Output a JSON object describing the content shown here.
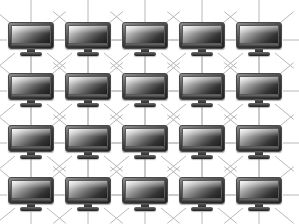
{
  "diagram": {
    "type": "network-mesh-grid",
    "background_color": "#ffffff",
    "link_color": "#b8b8b8",
    "link_width": 1,
    "canvas": {
      "width": 299,
      "height": 224
    },
    "grid": {
      "columns": 5,
      "rows": 4,
      "column_x": [
        31,
        88,
        145,
        202,
        259
      ],
      "row_y": [
        40,
        91,
        143,
        195
      ],
      "column_spacing": 57,
      "row_spacing": 51
    },
    "node": {
      "icon": "computer-monitor-icon",
      "label": "",
      "width": 46,
      "height": 36,
      "bezel_color": "#2b2b2b",
      "screen_gradient_from": "#f2f2f2",
      "screen_gradient_to": "#1d1d1d",
      "stand_color": "#3a3a3a"
    },
    "links": {
      "directions": [
        "horizontal",
        "vertical",
        "diagonal-down-right",
        "diagonal-down-left"
      ],
      "ray_length": 26,
      "description": "Each monitor node emits eight connector rays; rays meet midway to form horizontal bars, vertical bars and X crossings between neighbouring nodes."
    },
    "node_count": 20,
    "nodes": [
      {
        "id": "node-r1-c1",
        "row": 1,
        "col": 1,
        "x": 31,
        "y": 40
      },
      {
        "id": "node-r1-c2",
        "row": 1,
        "col": 2,
        "x": 88,
        "y": 40
      },
      {
        "id": "node-r1-c3",
        "row": 1,
        "col": 3,
        "x": 145,
        "y": 40
      },
      {
        "id": "node-r1-c4",
        "row": 1,
        "col": 4,
        "x": 202,
        "y": 40
      },
      {
        "id": "node-r1-c5",
        "row": 1,
        "col": 5,
        "x": 259,
        "y": 40
      },
      {
        "id": "node-r2-c1",
        "row": 2,
        "col": 1,
        "x": 31,
        "y": 91
      },
      {
        "id": "node-r2-c2",
        "row": 2,
        "col": 2,
        "x": 88,
        "y": 91
      },
      {
        "id": "node-r2-c3",
        "row": 2,
        "col": 3,
        "x": 145,
        "y": 91
      },
      {
        "id": "node-r2-c4",
        "row": 2,
        "col": 4,
        "x": 202,
        "y": 91
      },
      {
        "id": "node-r2-c5",
        "row": 2,
        "col": 5,
        "x": 259,
        "y": 91
      },
      {
        "id": "node-r3-c1",
        "row": 3,
        "col": 1,
        "x": 31,
        "y": 143
      },
      {
        "id": "node-r3-c2",
        "row": 3,
        "col": 2,
        "x": 88,
        "y": 143
      },
      {
        "id": "node-r3-c3",
        "row": 3,
        "col": 3,
        "x": 145,
        "y": 143
      },
      {
        "id": "node-r3-c4",
        "row": 3,
        "col": 4,
        "x": 202,
        "y": 143
      },
      {
        "id": "node-r3-c5",
        "row": 3,
        "col": 5,
        "x": 259,
        "y": 143
      },
      {
        "id": "node-r4-c1",
        "row": 4,
        "col": 1,
        "x": 31,
        "y": 195
      },
      {
        "id": "node-r4-c2",
        "row": 4,
        "col": 2,
        "x": 88,
        "y": 195
      },
      {
        "id": "node-r4-c3",
        "row": 4,
        "col": 3,
        "x": 145,
        "y": 195
      },
      {
        "id": "node-r4-c4",
        "row": 4,
        "col": 4,
        "x": 202,
        "y": 195
      },
      {
        "id": "node-r4-c5",
        "row": 4,
        "col": 5,
        "x": 259,
        "y": 195
      }
    ]
  }
}
